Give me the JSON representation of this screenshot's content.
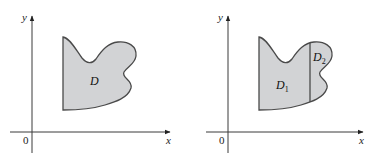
{
  "figure": {
    "panels": [
      {
        "id": "left",
        "axes": {
          "x_label": "x",
          "y_label": "y",
          "origin_label": "0"
        },
        "regions": [
          {
            "label": "D",
            "subscript": ""
          }
        ]
      },
      {
        "id": "right",
        "axes": {
          "x_label": "x",
          "y_label": "y",
          "origin_label": "0"
        },
        "regions": [
          {
            "label": "D",
            "subscript": "1"
          },
          {
            "label": "D",
            "subscript": "2"
          }
        ]
      }
    ],
    "colors": {
      "region_fill": "#d2d3d5",
      "region_stroke": "#4a4a4a",
      "axis": "#3a3a3a",
      "background": "#ffffff"
    }
  }
}
